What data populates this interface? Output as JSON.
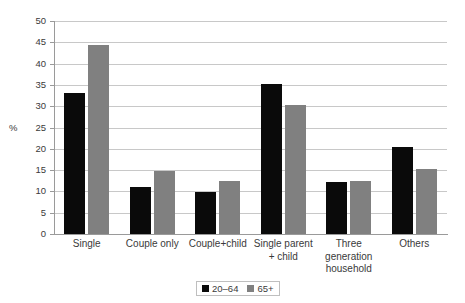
{
  "chart_data": {
    "type": "bar",
    "title": "",
    "subtitle": "",
    "xlabel": "",
    "ylabel": "%",
    "ylim": [
      0,
      50
    ],
    "ytick_step": 5,
    "yticks": [
      50,
      45,
      40,
      35,
      30,
      25,
      20,
      15,
      10,
      5,
      0
    ],
    "grid": true,
    "legend_position": "bottom",
    "categories": [
      "Single",
      "Couple only",
      "Couple+child",
      "Single parent\n+ child",
      "Three\ngeneration\nhousehold",
      "Others"
    ],
    "category_lines": [
      [
        "Single"
      ],
      [
        "Couple only"
      ],
      [
        "Couple+child"
      ],
      [
        "Single parent",
        "+ child"
      ],
      [
        "Three",
        "generation",
        "household"
      ],
      [
        "Others"
      ]
    ],
    "series": [
      {
        "name": "20–64",
        "color": "#0a0a0a",
        "values": [
          33.2,
          11.0,
          9.8,
          35.1,
          12.3,
          20.5
        ]
      },
      {
        "name": "65+",
        "color": "#808080",
        "values": [
          44.4,
          14.7,
          12.5,
          30.3,
          12.5,
          15.3
        ]
      }
    ]
  },
  "colors": {
    "series_20_64": "#0a0a0a",
    "series_65_plus": "#808080",
    "gridline": "#c8c8c8",
    "axis": "#9a9a9a",
    "text": "#3a3a3a",
    "legend_border": "#bfbfbf",
    "background": "#ffffff"
  }
}
